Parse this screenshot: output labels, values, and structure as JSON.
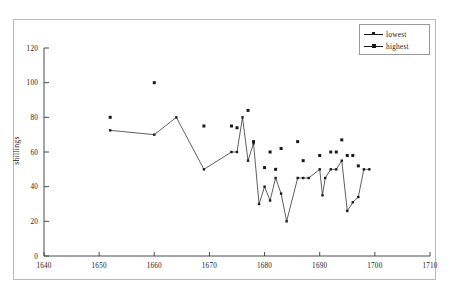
{
  "chart_data": {
    "type": "scatter",
    "title": "",
    "xlabel": "",
    "ylabel": "shillings",
    "xlim": [
      1640,
      1710
    ],
    "ylim": [
      0,
      120
    ],
    "xticks": [
      1640,
      1650,
      1660,
      1670,
      1680,
      1690,
      1700,
      1710
    ],
    "xticklabels": [
      "1640",
      "1650",
      "1660",
      "1670",
      "1680",
      "1690",
      "1700",
      "1710"
    ],
    "yticks": [
      0,
      20,
      40,
      60,
      80,
      100,
      120
    ],
    "yticklabels": [
      "0",
      "20",
      "40",
      "60",
      "80",
      "100",
      "120"
    ],
    "grid": false,
    "legend_position": "upper right",
    "series": [
      {
        "name": "lowest",
        "marker": "small-square",
        "connected": true,
        "points": [
          [
            1652,
            72.5
          ],
          [
            1660,
            70
          ],
          [
            1664,
            80
          ],
          [
            1669,
            50
          ],
          [
            1674,
            60
          ],
          [
            1675,
            60
          ],
          [
            1676,
            80
          ],
          [
            1677,
            55
          ],
          [
            1678,
            65
          ],
          [
            1679,
            30
          ],
          [
            1680,
            40
          ],
          [
            1681,
            32
          ],
          [
            1682,
            45
          ],
          [
            1683,
            36
          ],
          [
            1684,
            20
          ],
          [
            1686,
            45
          ],
          [
            1687,
            45
          ],
          [
            1688,
            45
          ],
          [
            1690,
            50
          ],
          [
            1690.5,
            35
          ],
          [
            1691,
            45
          ],
          [
            1692,
            50
          ],
          [
            1693,
            50
          ],
          [
            1694,
            55
          ],
          [
            1695,
            26
          ],
          [
            1696,
            31
          ],
          [
            1697,
            34
          ],
          [
            1698,
            50
          ],
          [
            1699,
            50
          ]
        ]
      },
      {
        "name": "highest",
        "marker": "square",
        "connected": false,
        "points": [
          [
            1652,
            80
          ],
          [
            1660,
            100
          ],
          [
            1669,
            75
          ],
          [
            1674,
            75
          ],
          [
            1675,
            74
          ],
          [
            1677,
            84
          ],
          [
            1678,
            66
          ],
          [
            1680,
            51
          ],
          [
            1681,
            60
          ],
          [
            1682,
            50
          ],
          [
            1683,
            62
          ],
          [
            1686,
            66
          ],
          [
            1687,
            55
          ],
          [
            1690,
            58
          ],
          [
            1692,
            60
          ],
          [
            1693,
            60
          ],
          [
            1694,
            67
          ],
          [
            1695,
            58
          ],
          [
            1696,
            58
          ],
          [
            1697,
            52
          ]
        ]
      }
    ]
  },
  "legend": {
    "items": [
      {
        "label": "lowest"
      },
      {
        "label": "highest"
      }
    ]
  },
  "axis": {
    "y_title": "shillings"
  },
  "colors": {
    "ink": "#1a1a1a",
    "axis": "#4a4a4a",
    "frame": "#b9b9b9",
    "background": "#ffffff"
  },
  "caption": ""
}
